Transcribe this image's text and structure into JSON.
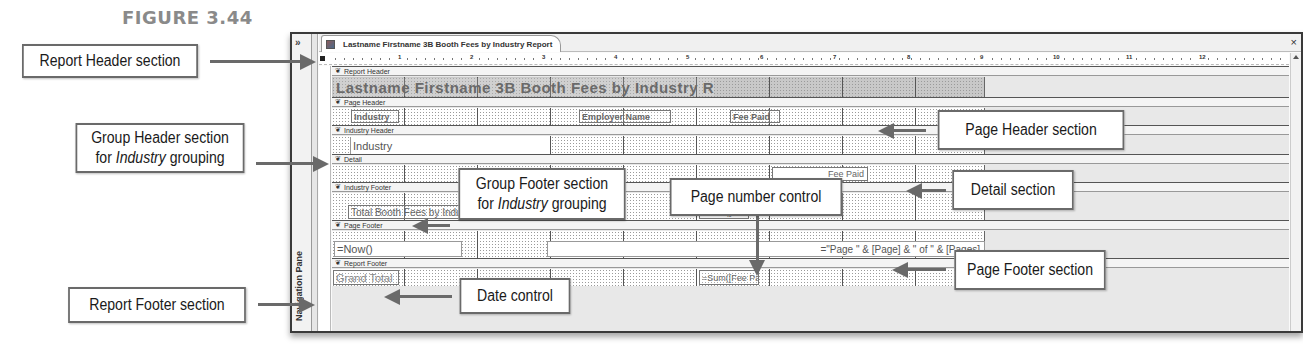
{
  "figure": {
    "label": "FIGURE 3.44"
  },
  "window": {
    "nav_toggle": "»",
    "nav_pane_label": "Navigation Pane",
    "tab_title": "Lastname Firstname 3B Booth Fees by Industry Report",
    "close_label": "×",
    "ruler_marks": [
      "1",
      "2",
      "3",
      "4",
      "5",
      "6",
      "7",
      "8",
      "9",
      "10",
      "11",
      "12"
    ]
  },
  "sections": {
    "report_header": {
      "bar": "Report Header",
      "title_control": "Lastname Firstname 3B Booth Fees by Industry Report"
    },
    "page_header": {
      "bar": "Page Header",
      "labels": [
        "Industry",
        "Employer Name",
        "Fee Paid"
      ]
    },
    "industry_header": {
      "bar": "Industry Header",
      "field": "Industry"
    },
    "detail": {
      "bar": "Detail",
      "field_fee_paid": "Fee Paid"
    },
    "industry_footer": {
      "bar": "Industry Footer",
      "label": "Total Booth Fees by Industry",
      "sum": "=Sum([Fee Paid])"
    },
    "page_footer": {
      "bar": "Page Footer",
      "date": "=Now()",
      "page_number": "=\"Page \" & [Page] & \" of \" & [Pages]"
    },
    "report_footer": {
      "bar": "Report Footer",
      "label": "Grand Total",
      "sum": "=Sum([Fee Paid])"
    }
  },
  "callouts": {
    "report_header": "Report Header section",
    "group_header_line1": "Group Header section",
    "group_header_pre": "for ",
    "group_header_em": "Industry",
    "group_header_post": " grouping",
    "report_footer": "Report Footer section",
    "group_footer_line1": "Group Footer section",
    "group_footer_pre": "for ",
    "group_footer_em": "Industry",
    "group_footer_post": " grouping",
    "page_number": "Page number control",
    "date": "Date control",
    "page_header": "Page Header section",
    "detail": "Detail section",
    "page_footer": "Page Footer section"
  }
}
